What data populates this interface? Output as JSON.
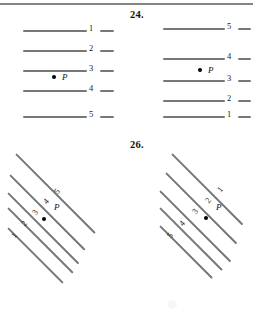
{
  "document": {
    "type": "textbook-exercise-page",
    "background_color": "#ffffff",
    "line_color": "#777777",
    "ink_color": "#111111"
  },
  "figures": [
    {
      "id": "fig-23",
      "problem_number": "",
      "style": "horizontal-parallel-lines",
      "point_label": "P",
      "line_labels": [
        "1",
        "2",
        "3",
        "4",
        "5"
      ],
      "lines": [
        {
          "label": "1",
          "y": 22
        },
        {
          "label": "2",
          "y": 42
        },
        {
          "label": "3",
          "y": 62
        },
        {
          "label": "4",
          "y": 82
        },
        {
          "label": "5",
          "y": 108
        }
      ],
      "point": {
        "label": "P",
        "x": 52,
        "y": 67
      }
    },
    {
      "id": "fig-24",
      "problem_number": "24.",
      "style": "horizontal-parallel-lines",
      "point_label": "P",
      "line_labels": [
        "5",
        "4",
        "3",
        "2",
        "1"
      ],
      "lines": [
        {
          "label": "5",
          "y": 20
        },
        {
          "label": "4",
          "y": 50
        },
        {
          "label": "3",
          "y": 72
        },
        {
          "label": "2",
          "y": 92
        },
        {
          "label": "1",
          "y": 108
        }
      ],
      "point": {
        "label": "P",
        "x": 58,
        "y": 62
      }
    },
    {
      "id": "fig-25",
      "problem_number": "",
      "style": "diagonal-parallel-lines",
      "point_label": "P",
      "line_labels": [
        "5",
        "4",
        "3",
        "2",
        "1"
      ],
      "point": {
        "label": "P",
        "x": 46,
        "y": 62
      }
    },
    {
      "id": "fig-26",
      "problem_number": "26.",
      "style": "diagonal-parallel-lines",
      "point_label": "P",
      "line_labels": [
        "1",
        "2",
        "3",
        "4",
        "5"
      ],
      "point": {
        "label": "P",
        "x": 62,
        "y": 70
      }
    }
  ]
}
